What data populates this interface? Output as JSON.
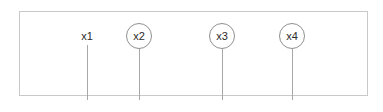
{
  "diagram": {
    "width": 383,
    "height": 112,
    "background_color": "#ffffff",
    "frame": {
      "name": "bounding-rectangle",
      "x": 19,
      "y": 11,
      "width": 349,
      "height": 85,
      "border_color": "#c9c9c9",
      "border_width": 1,
      "fill_color": "#ffffff"
    },
    "style": {
      "line_color": "#a8a8a8",
      "circle_border_color": "#8f8f8f",
      "circle_border_width": 1,
      "label_color": "#2b2b2b",
      "label_font_size": 11,
      "circle_diameter": 26
    },
    "markers": [
      {
        "label": "x1",
        "name": "marker-x1",
        "circled": false,
        "x": 87,
        "label_center_y": 36,
        "line_top": 45,
        "line_bottom": 100
      },
      {
        "label": "x2",
        "name": "marker-x2",
        "circled": true,
        "x": 139,
        "label_center_y": 36,
        "line_top": 49,
        "line_bottom": 100
      },
      {
        "label": "x3",
        "name": "marker-x3",
        "circled": true,
        "x": 222,
        "label_center_y": 36,
        "line_top": 49,
        "line_bottom": 100
      },
      {
        "label": "x4",
        "name": "marker-x4",
        "circled": true,
        "x": 292,
        "label_center_y": 36,
        "line_top": 49,
        "line_bottom": 100
      }
    ]
  }
}
